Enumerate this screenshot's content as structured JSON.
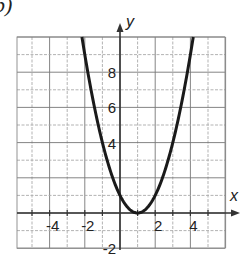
{
  "figure": {
    "part_label": "b)"
  },
  "chart_data": {
    "type": "line",
    "title": "",
    "xlabel": "x",
    "ylabel": "y",
    "xlim": [
      -6,
      6
    ],
    "ylim": [
      -2,
      10
    ],
    "grid": true,
    "grid_step": 1,
    "x_tick_labels": [
      "-4",
      "-2",
      "2",
      "4"
    ],
    "x_tick_values": [
      -4,
      -2,
      2,
      4
    ],
    "y_tick_labels": [
      "8",
      "6",
      "4",
      "-2"
    ],
    "y_tick_values": [
      8,
      6,
      4,
      -2
    ],
    "series": [
      {
        "name": "y = (x - 1)^2",
        "equation": "y = (x-1)^2",
        "vertex": [
          1,
          0
        ],
        "x": [
          -2.16,
          -2,
          -1.5,
          -1,
          -0.5,
          0,
          0.5,
          1,
          1.5,
          2,
          2.5,
          3,
          3.5,
          4,
          4.16
        ],
        "y": [
          10,
          9,
          6.25,
          4,
          2.25,
          1,
          0.25,
          0,
          0.25,
          1,
          2.25,
          4,
          6.25,
          9,
          10
        ],
        "color": "#1a1a1a"
      }
    ],
    "legend": "none"
  }
}
